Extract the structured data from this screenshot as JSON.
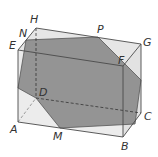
{
  "figure": {
    "type": "cuboid-cross-section",
    "colors": {
      "face_fill": "#e4e4e4",
      "section_fill": "#8c8c8c",
      "edge": "#4a4a4a",
      "label": "#333333"
    },
    "vertices": {
      "A": {
        "label": "A"
      },
      "B": {
        "label": "B"
      },
      "C": {
        "label": "C"
      },
      "D": {
        "label": "D"
      },
      "E": {
        "label": "E"
      },
      "F": {
        "label": "F"
      },
      "G": {
        "label": "G"
      },
      "H": {
        "label": "H"
      },
      "M": {
        "label": "M"
      },
      "N": {
        "label": "N"
      },
      "P": {
        "label": "P"
      }
    }
  }
}
